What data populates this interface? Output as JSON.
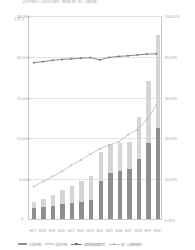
{
  "chart_data": {
    "type": "bar",
    "title": "認定件数及び認定率の推移（精神障害・脳・心臓疾患）",
    "xlabel": "",
    "ylabel": "（人）",
    "ylim": [
      0,
      25000
    ],
    "y2lim": [
      0,
      100
    ],
    "grid": true,
    "legend_position": "bottom",
    "categories": [
      "H17",
      "H18",
      "H19",
      "H20",
      "H21",
      "H22",
      "H23",
      "H24",
      "H25",
      "H26",
      "H27",
      "H28",
      "H29",
      "H30"
    ],
    "left_axis_ticks": [
      "0",
      "5,000",
      "10,000",
      "15,000",
      "20,000",
      "25,000"
    ],
    "right_axis_ticks": [
      "0.0%",
      "20.0%",
      "40.0%",
      "60.0%",
      "80.0%",
      "100.0%"
    ],
    "series": [
      {
        "name": "請求件数（うち支給決定件数）",
        "kind": "bar-stack-lower",
        "color": "#8e8e8e",
        "values": [
          1320,
          1460,
          1620,
          1780,
          1920,
          2100,
          2280,
          4600,
          5700,
          5900,
          6100,
          7300,
          9300,
          11200
        ]
      },
      {
        "name": "請求件数（うち不支給等件数）",
        "kind": "bar-stack-upper",
        "color": "#d5d5d5",
        "values": [
          760,
          1040,
          1380,
          1720,
          2080,
          2500,
          3020,
          3600,
          3500,
          3400,
          3300,
          5200,
          7600,
          11300
        ]
      },
      {
        "name": "支給決定率",
        "kind": "line",
        "color": "#7b7b7b",
        "values": [
          77.0,
          77.5,
          78.2,
          78.6,
          78.9,
          79.2,
          79.5,
          78.4,
          79.6,
          80.1,
          80.4,
          80.8,
          81.2,
          81.4
        ]
      },
      {
        "name": "認定率（精神障害事案）",
        "kind": "line",
        "color": "#c2c2c2",
        "values": [
          16.0,
          18.5,
          21.0,
          23.5,
          26.5,
          29.0,
          32.0,
          34.5,
          36.5,
          38.0,
          41.5,
          44.0,
          49.0,
          56.0
        ]
      }
    ],
    "legend": [
      {
        "label": "請求件数",
        "marker": "bar-dark"
      },
      {
        "label": "認定件数",
        "marker": "bar-light"
      },
      {
        "label": "精神障害事案率",
        "marker": "line-dark"
      },
      {
        "label": "脳・心臓疾患率",
        "marker": "line-light"
      }
    ]
  }
}
